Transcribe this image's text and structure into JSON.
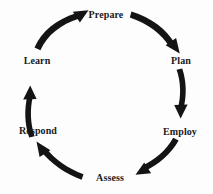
{
  "diagram": {
    "type": "cycle",
    "title": "",
    "background_color": "#fdfdfd",
    "line_color": "#141414",
    "text_color": "#1a1a1a",
    "direction": "clockwise",
    "center": {
      "x": 105,
      "y": 96
    },
    "radius": 70,
    "nodes": [
      {
        "id": "prepare",
        "label": "Prepare",
        "x": 106,
        "y": 14,
        "angle_deg": 270
      },
      {
        "id": "plan",
        "label": "Plan",
        "x": 181,
        "y": 60,
        "angle_deg": 330
      },
      {
        "id": "employ",
        "label": "Employ",
        "x": 180,
        "y": 131,
        "angle_deg": 30
      },
      {
        "id": "assess",
        "label": "Assess",
        "x": 110,
        "y": 177,
        "angle_deg": 90
      },
      {
        "id": "respond",
        "label": "Respond",
        "x": 38,
        "y": 130,
        "angle_deg": 150
      },
      {
        "id": "learn",
        "label": "Learn",
        "x": 37,
        "y": 60,
        "angle_deg": 210
      }
    ],
    "edges": [
      {
        "id": "learn-to-prepare",
        "from": "learn",
        "to": "prepare",
        "arrow": "up-right"
      },
      {
        "id": "prepare-to-plan",
        "from": "prepare",
        "to": "plan",
        "arrow": "down-right"
      },
      {
        "id": "plan-to-employ",
        "from": "plan",
        "to": "employ",
        "arrow": "down"
      },
      {
        "id": "employ-to-assess",
        "from": "employ",
        "to": "assess",
        "arrow": "down-left"
      },
      {
        "id": "assess-to-respond",
        "from": "assess",
        "to": "respond",
        "arrow": "up-left"
      },
      {
        "id": "respond-to-learn",
        "from": "respond",
        "to": "learn",
        "arrow": "up"
      }
    ]
  }
}
